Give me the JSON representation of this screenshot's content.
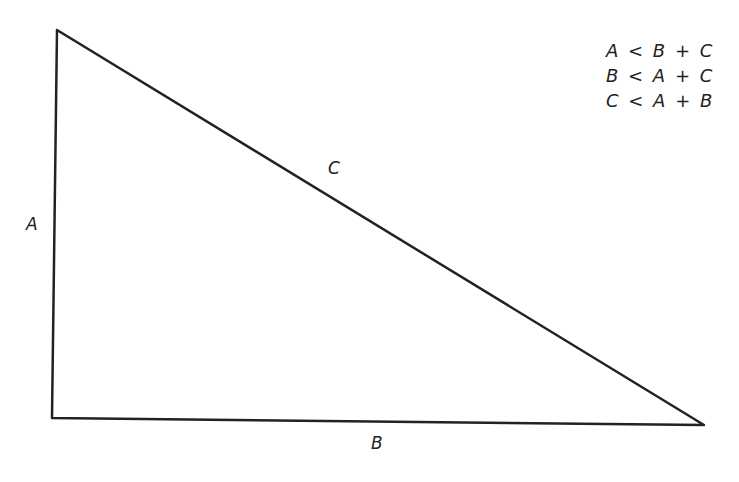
{
  "diagram": {
    "side_labels": {
      "a": "A",
      "b": "B",
      "c": "C"
    },
    "inequalities": [
      "A < B + C",
      "B < A + C",
      "C < A + B"
    ],
    "vertices": {
      "top": [
        57,
        30
      ],
      "bottom_left": [
        52,
        418
      ],
      "bottom_right": [
        704,
        425
      ]
    },
    "stroke_color": "#222222"
  }
}
